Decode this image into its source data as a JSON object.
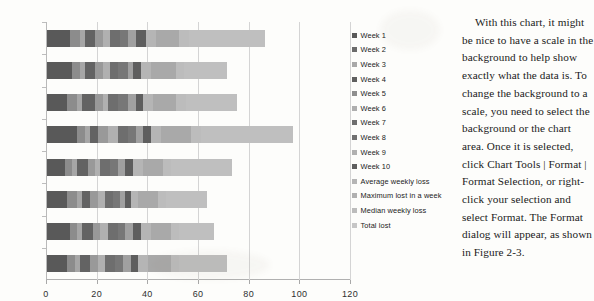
{
  "chart_data": {
    "type": "bar",
    "orientation": "horizontal",
    "stacked": true,
    "title": "",
    "xlabel": "",
    "ylabel": "",
    "xlim": [
      0,
      120
    ],
    "xticks": [
      0,
      20,
      40,
      60,
      80,
      100,
      120
    ],
    "grid": true,
    "legend_position": "right",
    "categories": [
      "Michael",
      "Sarah",
      "Linda",
      "Larry",
      "Harry",
      "Mary",
      "John",
      "Jane"
    ],
    "series": [
      {
        "name": "Week 1",
        "color": "#595959",
        "values": [
          9,
          10,
          8,
          12,
          7,
          8,
          9,
          8
        ]
      },
      {
        "name": "Week 2",
        "color": "#8c8c8c",
        "values": [
          4,
          3,
          4,
          3,
          3,
          4,
          3,
          3
        ]
      },
      {
        "name": "Week 3",
        "color": "#a6a6a6",
        "values": [
          2,
          2,
          2,
          2,
          2,
          2,
          2,
          2
        ]
      },
      {
        "name": "Week 4",
        "color": "#636363",
        "values": [
          4,
          4,
          5,
          3,
          4,
          3,
          4,
          4
        ]
      },
      {
        "name": "Week 5",
        "color": "#999999",
        "values": [
          3,
          3,
          3,
          4,
          3,
          3,
          3,
          3
        ]
      },
      {
        "name": "Week 6",
        "color": "#b0b0b0",
        "values": [
          3,
          3,
          2,
          4,
          2,
          3,
          3,
          3
        ]
      },
      {
        "name": "Week 7",
        "color": "#6e6e6e",
        "values": [
          4,
          3,
          4,
          4,
          4,
          3,
          4,
          4
        ]
      },
      {
        "name": "Week 8",
        "color": "#777777",
        "values": [
          3,
          4,
          4,
          3,
          3,
          3,
          3,
          3
        ]
      },
      {
        "name": "Week 9",
        "color": "#a0a0a0",
        "values": [
          3,
          2,
          3,
          3,
          3,
          2,
          3,
          3
        ]
      },
      {
        "name": "Week 10",
        "color": "#5e5e5e",
        "values": [
          4,
          3,
          3,
          3,
          3,
          2,
          3,
          3
        ]
      },
      {
        "name": "Average weekly loss",
        "color": "#b5b5b5",
        "values": [
          4,
          4,
          4,
          4,
          4,
          3,
          4,
          4
        ]
      },
      {
        "name": "Maximum lost in a week",
        "color": "#a9a9a9",
        "values": [
          9,
          10,
          9,
          12,
          8,
          8,
          8,
          9
        ]
      },
      {
        "name": "Median weekly loss",
        "color": "#bcbcbc",
        "values": [
          4,
          3,
          4,
          4,
          3,
          3,
          3,
          3
        ]
      },
      {
        "name": "Total lost",
        "color": "#bfbfbf",
        "values": [
          30,
          17,
          20,
          36,
          24,
          16,
          14,
          19
        ]
      }
    ],
    "totals": [
      86,
      71,
      75,
      97,
      73,
      63,
      66,
      71
    ]
  },
  "legend": {
    "items": [
      {
        "label": "Week 1",
        "color": "#595959"
      },
      {
        "label": "Week 2",
        "color": "#6b6b6b"
      },
      {
        "label": "Week 3",
        "color": "#a8a8a8"
      },
      {
        "label": "Week 4",
        "color": "#5f5f5f"
      },
      {
        "label": "Week 5",
        "color": "#8e8e8e"
      },
      {
        "label": "Week 6",
        "color": "#aeaeae"
      },
      {
        "label": "Week 7",
        "color": "#6e6e6e"
      },
      {
        "label": "Week 8",
        "color": "#707070"
      },
      {
        "label": "Week 9",
        "color": "#b0b0b0"
      },
      {
        "label": "Week 10",
        "color": "#5e5e5e"
      },
      {
        "label": "Average weekly loss",
        "color": "#b5b5b5"
      },
      {
        "label": "Maximum lost in a week",
        "color": "#b0b0b0"
      },
      {
        "label": "Median weekly loss",
        "color": "#bcbcbc"
      },
      {
        "label": "Total lost",
        "color": "#c6c6c6"
      }
    ]
  },
  "body_text": {
    "paragraph": "With this chart, it might be nice to have a scale in the background to help show exactly what the data is. To change the background to a scale, you need to select the background or the chart area. Once it is selected, click Chart Tools | Format | Format Selection, or right-click your selection and select Format. The Format dialog will appear, as shown in Figure 2-3."
  }
}
